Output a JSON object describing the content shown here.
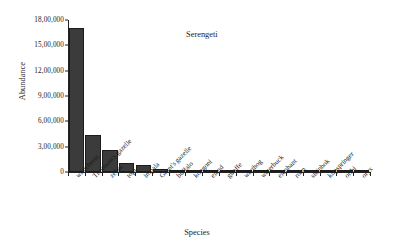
{
  "chart_data": {
    "type": "bar",
    "title": "Serengeti",
    "xlabel": "Species",
    "ylabel": "Abundance",
    "ylim": [
      0,
      1800000
    ],
    "ytick_step": 300000,
    "ytick_labels": [
      "0",
      "3,00,000",
      "6,00,000",
      "9,00,000",
      "12,00,000",
      "15,00,000",
      "18,00,000"
    ],
    "ytick_values": [
      0,
      300000,
      600000,
      900000,
      1200000,
      1500000,
      1800000
    ],
    "number_format": "indian-grouping",
    "grid": false,
    "legend": "none",
    "bar_color": "#3b3b3b",
    "categories": [
      "wildebeest",
      "Thomson's gazelle",
      "zebra",
      "topi",
      "impala",
      "Grant's gazelle",
      "buffalo",
      "kongoni",
      "eland",
      "giraffe",
      "warthog",
      "waterbuck",
      "elephant",
      "roan",
      "steinbok",
      "klipspringer",
      "oribi",
      "oryx"
    ],
    "values": [
      1700000,
      440000,
      260000,
      110000,
      80000,
      35000,
      18000,
      15000,
      14000,
      12000,
      10000,
      3000,
      2500,
      900,
      700,
      500,
      400,
      300
    ]
  },
  "figure": {
    "caption_title": "Serengeti"
  }
}
